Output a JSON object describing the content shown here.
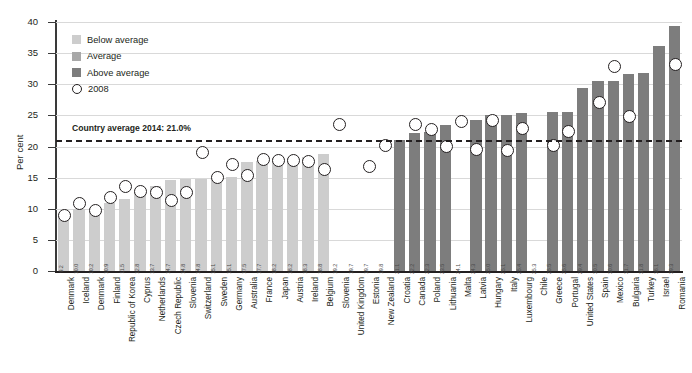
{
  "chart_data": {
    "type": "bar",
    "title": "",
    "xlabel": "",
    "ylabel": "Per cent",
    "ylim": [
      0,
      40
    ],
    "ytick_values": [
      0,
      5,
      10,
      15,
      20,
      25,
      30,
      35,
      40
    ],
    "grid": true,
    "legend_position": "top-left",
    "categories": [
      "Denmark",
      "Iceland",
      "Denmark",
      "Finland",
      "Republic of Korea",
      "Cyprus",
      "Netherlands",
      "Czech Republic",
      "Slovenia",
      "Switzerland",
      "Sweden",
      "Germany",
      "Australia",
      "France",
      "Japan",
      "Austria",
      "Ireland",
      "Belgium",
      "Slovenia",
      "United Kingdom",
      "Estonia",
      "New Zealand",
      "Croatia",
      "Canada",
      "Poland",
      "Lithuania",
      "Malta",
      "Latvia",
      "Hungary",
      "Italy",
      "Luxembourg",
      "Chile",
      "Greece",
      "Portugal",
      "United States",
      "Spain",
      "Mexico",
      "Bulgaria",
      "Turkey",
      "Israel",
      "Romania"
    ],
    "values": [
      9.2,
      10.0,
      10.2,
      10.9,
      11.5,
      12.8,
      13.7,
      14.7,
      14.8,
      14.8,
      15.1,
      15.1,
      17.5,
      17.7,
      18.2,
      18.2,
      18.3,
      18.8,
      19.2,
      19.7,
      19.7,
      19.8,
      21.1,
      22.2,
      22.3,
      23.5,
      24.1,
      24.3,
      25.0,
      25.1,
      25.4,
      25.3,
      25.5,
      25.6,
      29.4,
      30.5,
      30.6,
      31.7,
      31.8,
      36.1,
      39.3
    ],
    "value_labels": [
      "9.2",
      "10.0",
      "10.2",
      "10.9",
      "11.5",
      "12.8",
      "13.7",
      "14.7",
      "14.8",
      "14.8",
      "15.1",
      "15.1",
      "17.5",
      "17.7",
      "18.2",
      "18.2",
      "18.3",
      "18.8",
      "19.2",
      "19.7",
      "19.7",
      "19.8",
      "21.1",
      "22.2",
      "22.3",
      "23.5",
      "24.1",
      "24.3",
      "25.0",
      "25.1",
      "25.4",
      "25.3",
      "25.5",
      "25.6",
      "29.4",
      "30.5",
      "30.6",
      "31.7",
      "31.8",
      "36.1",
      "39.3"
    ],
    "bar_groups": [
      "below",
      "below",
      "below",
      "below",
      "below",
      "below",
      "below",
      "below",
      "below",
      "below",
      "below",
      "below",
      "below",
      "below",
      "below",
      "below",
      "below",
      "below",
      "average",
      "average",
      "average",
      "average",
      "above",
      "above",
      "above",
      "above",
      "average",
      "above",
      "above",
      "above",
      "above",
      "average",
      "above",
      "above",
      "above",
      "above",
      "above",
      "above",
      "above",
      "above",
      "above"
    ],
    "series": [
      {
        "name": "2008",
        "type": "scatter",
        "marker": "open-circle",
        "values": [
          9.0,
          11.0,
          9.8,
          12.0,
          13.7,
          13.0,
          12.8,
          11.5,
          12.8,
          19.2,
          15.2,
          17.3,
          15.5,
          18.0,
          17.9,
          17.9,
          17.8,
          16.4,
          23.7,
          null,
          17.0,
          20.3,
          null,
          23.7,
          22.9,
          20.2,
          24.2,
          19.6,
          24.3,
          19.5,
          23.0,
          null,
          20.3,
          22.5,
          null,
          27.2,
          33.0,
          25.0,
          null,
          null,
          33.3
        ]
      }
    ],
    "reference_line": {
      "label": "Country average 2014: 21.0%",
      "value": 21.0,
      "style": "dashed"
    },
    "colors": {
      "below_average": "#cdcdcd",
      "average": "#a8a8a8",
      "above_average": "#7d7d7d",
      "marker_edge": "#231f20",
      "marker_fill": "#ffffff",
      "reference_line": "#231f20",
      "gridline": "#d9d9d9",
      "axis": "#231f20"
    }
  },
  "legend": {
    "items": [
      {
        "label": "Below average",
        "swatch": "below_average",
        "kind": "swatch"
      },
      {
        "label": "Average",
        "swatch": "average",
        "kind": "swatch"
      },
      {
        "label": "Above average",
        "swatch": "above_average",
        "kind": "swatch"
      },
      {
        "label": "2008",
        "swatch": "marker_fill",
        "kind": "circle"
      }
    ]
  }
}
